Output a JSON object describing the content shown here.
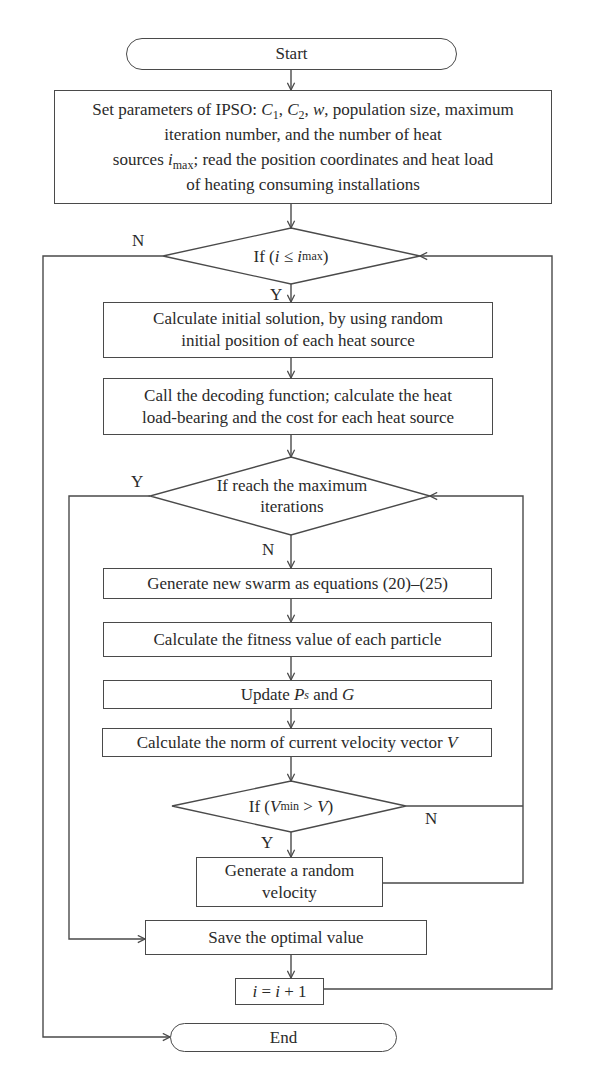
{
  "diagram": {
    "type": "flowchart",
    "nodes": {
      "start": {
        "label": "Start"
      },
      "set_params": {
        "line1_a": "Set parameters of IPSO: ",
        "c1": "C",
        "c1_sub": "1",
        "sep1": ", ",
        "c2": "C",
        "c2_sub": "2",
        "sep2": ", ",
        "w": "w",
        "line1_b": ", population size, maximum",
        "line2": "iteration number, and the number of heat",
        "line3_a": "sources ",
        "imax": "i",
        "imax_sub": "max",
        "line3_b": "; read the position coordinates and heat load",
        "line4": "of heating consuming installations"
      },
      "cond_i": {
        "prefix": "If (",
        "var": "i",
        "op": " ≤ ",
        "var2": "i",
        "var2_sub": "max",
        "suffix": ")"
      },
      "init_solution": {
        "line1": "Calculate initial solution, by using random",
        "line2": "initial position of each heat source"
      },
      "decode": {
        "line1": "Call the decoding function; calculate the heat",
        "line2": "load-bearing and the cost for each heat source"
      },
      "cond_iter": {
        "line1": "If reach the maximum",
        "line2": "iterations"
      },
      "gen_swarm": {
        "label": "Generate new swarm as equations (20)–(25)"
      },
      "fitness": {
        "label": "Calculate the fitness value of each particle"
      },
      "update": {
        "prefix": "Update ",
        "ps": "P",
        "ps_sub": "s",
        "mid": " and ",
        "g": "G"
      },
      "norm": {
        "prefix": "Calculate the norm of current velocity vector ",
        "v": "V"
      },
      "cond_v": {
        "prefix": "If (",
        "vmin": "V",
        "vmin_sub": "min",
        "op": " > ",
        "v": "V",
        "suffix": ")"
      },
      "random_velocity": {
        "line1": "Generate a random",
        "line2": "velocity"
      },
      "save_optimal": {
        "label": "Save the optimal value"
      },
      "increment": {
        "i1": "i",
        "eq": " = ",
        "i2": "i",
        "plus": " + 1"
      },
      "end": {
        "label": "End"
      }
    },
    "edge_labels": {
      "cond_i_no": "N",
      "cond_i_yes": "Y",
      "cond_iter_yes": "Y",
      "cond_iter_no": "N",
      "cond_v_no": "N",
      "cond_v_yes": "Y"
    },
    "colors": {
      "stroke": "#4a4a4a",
      "text": "#2a2a2a",
      "background": "#ffffff"
    }
  }
}
